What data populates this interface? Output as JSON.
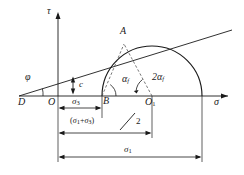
{
  "figure": {
    "type": "mohr-coulomb-failure-envelope",
    "axes": {
      "y_label": "τ",
      "x_label": "σ"
    },
    "points": {
      "D": "D",
      "O": "O",
      "B": "B",
      "A": "A",
      "O1_base": "O",
      "O1_sub": "1"
    },
    "angles": {
      "phi": "φ",
      "alpha_f_base": "α",
      "alpha_f_sub": "f",
      "two_alpha_f_base": "2α",
      "two_alpha_f_sub": "f"
    },
    "cohesion": {
      "label": "c"
    },
    "dimensions": {
      "sigma3_base": "σ",
      "sigma3_sub": "3",
      "center_expr_open": "(",
      "center_expr_s1": "σ",
      "center_expr_s1_sub": "1",
      "center_expr_plus": "+",
      "center_expr_s3": "σ",
      "center_expr_s3_sub": "3",
      "center_expr_close": ")",
      "center_expr_divisor": "2",
      "sigma1_base": "σ",
      "sigma1_sub": "1"
    },
    "colors": {
      "stroke": "#1a1a1a",
      "dashed": "#555555",
      "background": "#ffffff"
    },
    "geometry": {
      "origin_x": 58,
      "axis_y": 96,
      "circle_center_x": 152,
      "circle_radius": 50,
      "tangent_point_x": 124,
      "tangent_point_y": 44
    }
  }
}
